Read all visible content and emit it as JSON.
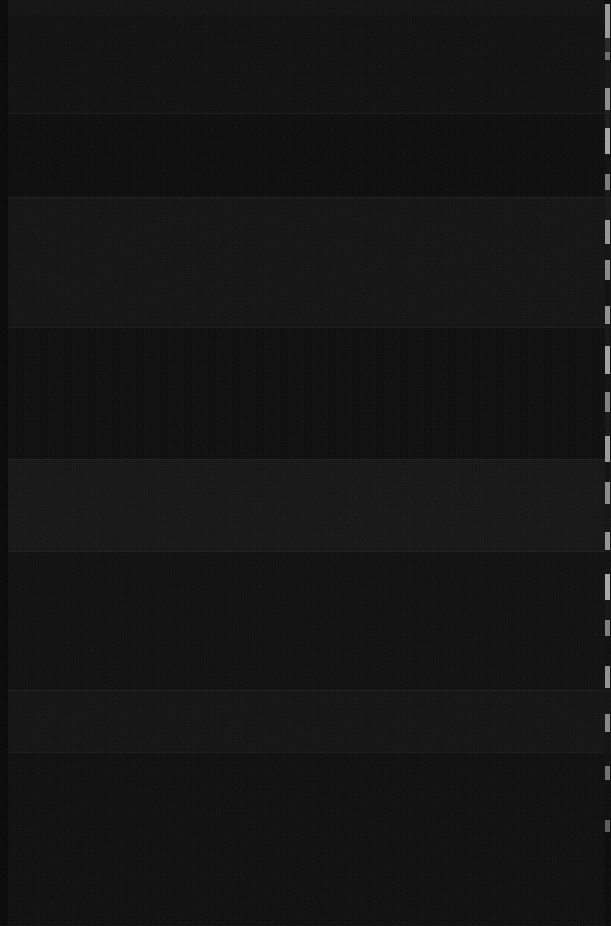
{
  "capture": {
    "width": 611,
    "height": 926,
    "state_label": "dark-screen",
    "description": "Near-black screen capture; no legible text or icons rendered in the pixels.",
    "background_color": "#0e0e0e",
    "noise_present": true
  },
  "layout": {
    "left_gutter": {
      "x": 0,
      "width": 8,
      "color": "#070707"
    },
    "top_strip": {
      "y": 0,
      "height": 14,
      "color": "#121212"
    },
    "bands": [
      {
        "top": 14,
        "height": 99,
        "color": "#101010"
      },
      {
        "top": 113,
        "height": 84,
        "color": "#0c0c0c"
      },
      {
        "top": 197,
        "height": 130,
        "color": "#131313"
      },
      {
        "top": 327,
        "height": 132,
        "color": "#0d0d0d"
      },
      {
        "top": 459,
        "height": 92,
        "color": "#151515"
      },
      {
        "top": 551,
        "height": 139,
        "color": "#0f0f0f"
      },
      {
        "top": 690,
        "height": 62,
        "color": "#131313"
      },
      {
        "top": 752,
        "height": 174,
        "color": "#0e0e0e"
      }
    ],
    "dividers": [
      113,
      197,
      327,
      459,
      551,
      690,
      752
    ]
  },
  "edge_sliver": {
    "x": 605,
    "width": 5,
    "base_color": "#0a0a0a",
    "segments": [
      {
        "top": 4,
        "height": 34,
        "color": "#9a9a9a"
      },
      {
        "top": 38,
        "height": 14,
        "color": "#262626"
      },
      {
        "top": 52,
        "height": 8,
        "color": "#6d6d6d"
      },
      {
        "top": 60,
        "height": 28,
        "color": "#141414"
      },
      {
        "top": 88,
        "height": 22,
        "color": "#8c8c8c"
      },
      {
        "top": 110,
        "height": 18,
        "color": "#1b1b1b"
      },
      {
        "top": 128,
        "height": 26,
        "color": "#a3a3a3"
      },
      {
        "top": 154,
        "height": 20,
        "color": "#101010"
      },
      {
        "top": 174,
        "height": 16,
        "color": "#7a7a7a"
      },
      {
        "top": 190,
        "height": 30,
        "color": "#171717"
      },
      {
        "top": 220,
        "height": 24,
        "color": "#959595"
      },
      {
        "top": 244,
        "height": 16,
        "color": "#121212"
      },
      {
        "top": 260,
        "height": 20,
        "color": "#888888"
      },
      {
        "top": 280,
        "height": 26,
        "color": "#0e0e0e"
      },
      {
        "top": 306,
        "height": 18,
        "color": "#8f8f8f"
      },
      {
        "top": 324,
        "height": 22,
        "color": "#151515"
      },
      {
        "top": 346,
        "height": 28,
        "color": "#a0a0a0"
      },
      {
        "top": 374,
        "height": 18,
        "color": "#111111"
      },
      {
        "top": 392,
        "height": 20,
        "color": "#7f7f7f"
      },
      {
        "top": 412,
        "height": 24,
        "color": "#161616"
      },
      {
        "top": 436,
        "height": 26,
        "color": "#999999"
      },
      {
        "top": 462,
        "height": 20,
        "color": "#0f0f0f"
      },
      {
        "top": 482,
        "height": 22,
        "color": "#8a8a8a"
      },
      {
        "top": 504,
        "height": 28,
        "color": "#131313"
      },
      {
        "top": 532,
        "height": 18,
        "color": "#939393"
      },
      {
        "top": 550,
        "height": 24,
        "color": "#101010"
      },
      {
        "top": 574,
        "height": 26,
        "color": "#a6a6a6"
      },
      {
        "top": 600,
        "height": 20,
        "color": "#141414"
      },
      {
        "top": 620,
        "height": 16,
        "color": "#7c7c7c"
      },
      {
        "top": 636,
        "height": 30,
        "color": "#0d0d0d"
      },
      {
        "top": 666,
        "height": 22,
        "color": "#909090"
      },
      {
        "top": 688,
        "height": 26,
        "color": "#121212"
      },
      {
        "top": 714,
        "height": 18,
        "color": "#868686"
      },
      {
        "top": 732,
        "height": 34,
        "color": "#101010"
      },
      {
        "top": 766,
        "height": 14,
        "color": "#6f6f6f"
      },
      {
        "top": 780,
        "height": 40,
        "color": "#0c0c0c"
      },
      {
        "top": 820,
        "height": 12,
        "color": "#5a5a5a"
      },
      {
        "top": 832,
        "height": 94,
        "color": "#0a0a0a"
      }
    ]
  }
}
